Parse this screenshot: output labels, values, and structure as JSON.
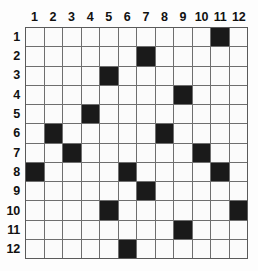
{
  "figure": {
    "name": "12x12 filled-cell grid",
    "rows": 12,
    "columns": 12,
    "colors": {
      "background": "#ffffff",
      "cell_empty": "#fbfbfb",
      "cell_filled": "#1a1a1a",
      "gridline": "#6e6e6e",
      "border": "#5a5a5a",
      "label_text": "#111111"
    }
  },
  "column_headers": [
    "1",
    "2",
    "3",
    "4",
    "5",
    "6",
    "7",
    "8",
    "9",
    "10",
    "11",
    "12"
  ],
  "row_headers": [
    "1",
    "2",
    "3",
    "4",
    "5",
    "6",
    "7",
    "8",
    "9",
    "10",
    "11",
    "12"
  ],
  "chart_data": {
    "type": "heatmap",
    "title": "",
    "xlabel": "",
    "ylabel": "",
    "categories": [
      "1",
      "2",
      "3",
      "4",
      "5",
      "6",
      "7",
      "8",
      "9",
      "10",
      "11",
      "12"
    ],
    "row_categories": [
      "1",
      "2",
      "3",
      "4",
      "5",
      "6",
      "7",
      "8",
      "9",
      "10",
      "11",
      "12"
    ],
    "legend": [],
    "grid": true,
    "value_labels": {
      "0": "empty",
      "1": "filled"
    },
    "filled_cells": [
      {
        "row": 1,
        "column": 11
      },
      {
        "row": 2,
        "column": 7
      },
      {
        "row": 3,
        "column": 5
      },
      {
        "row": 4,
        "column": 9
      },
      {
        "row": 5,
        "column": 4
      },
      {
        "row": 6,
        "column": 2
      },
      {
        "row": 6,
        "column": 8
      },
      {
        "row": 7,
        "column": 3
      },
      {
        "row": 7,
        "column": 10
      },
      {
        "row": 8,
        "column": 1
      },
      {
        "row": 8,
        "column": 6
      },
      {
        "row": 8,
        "column": 11
      },
      {
        "row": 9,
        "column": 7
      },
      {
        "row": 10,
        "column": 5
      },
      {
        "row": 10,
        "column": 12
      },
      {
        "row": 11,
        "column": 9
      },
      {
        "row": 12,
        "column": 6
      }
    ],
    "matrix": [
      [
        0,
        0,
        0,
        0,
        0,
        0,
        0,
        0,
        0,
        0,
        1,
        0
      ],
      [
        0,
        0,
        0,
        0,
        0,
        0,
        1,
        0,
        0,
        0,
        0,
        0
      ],
      [
        0,
        0,
        0,
        0,
        1,
        0,
        0,
        0,
        0,
        0,
        0,
        0
      ],
      [
        0,
        0,
        0,
        0,
        0,
        0,
        0,
        0,
        1,
        0,
        0,
        0
      ],
      [
        0,
        0,
        0,
        1,
        0,
        0,
        0,
        0,
        0,
        0,
        0,
        0
      ],
      [
        0,
        1,
        0,
        0,
        0,
        0,
        0,
        1,
        0,
        0,
        0,
        0
      ],
      [
        0,
        0,
        1,
        0,
        0,
        0,
        0,
        0,
        0,
        1,
        0,
        0
      ],
      [
        1,
        0,
        0,
        0,
        0,
        1,
        0,
        0,
        0,
        0,
        1,
        0
      ],
      [
        0,
        0,
        0,
        0,
        0,
        0,
        1,
        0,
        0,
        0,
        0,
        0
      ],
      [
        0,
        0,
        0,
        0,
        1,
        0,
        0,
        0,
        0,
        0,
        0,
        1
      ],
      [
        0,
        0,
        0,
        0,
        0,
        0,
        0,
        0,
        1,
        0,
        0,
        0
      ],
      [
        0,
        0,
        0,
        0,
        0,
        1,
        0,
        0,
        0,
        0,
        0,
        0
      ]
    ]
  }
}
